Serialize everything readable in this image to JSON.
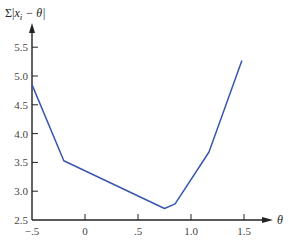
{
  "chart_data": {
    "type": "line",
    "title": "",
    "ylabel": "Σ|x_i − θ|",
    "xlabel": "θ",
    "xlim": [
      -0.5,
      1.7
    ],
    "ylim": [
      2.5,
      5.7
    ],
    "grid": false,
    "legend": null,
    "x_ticks": [
      {
        "value": -0.5,
        "label": "−.5"
      },
      {
        "value": 0,
        "label": "0"
      },
      {
        "value": 0.5,
        "label": ".5"
      },
      {
        "value": 1.0,
        "label": "1.0"
      },
      {
        "value": 1.5,
        "label": "1.5"
      }
    ],
    "y_ticks": [
      {
        "value": 2.5,
        "label": "2.5"
      },
      {
        "value": 3.0,
        "label": "3.0"
      },
      {
        "value": 3.5,
        "label": "3.5"
      },
      {
        "value": 4.0,
        "label": "4.0"
      },
      {
        "value": 4.5,
        "label": "4.5"
      },
      {
        "value": 5.0,
        "label": "5.0"
      },
      {
        "value": 5.5,
        "label": "5.5"
      }
    ],
    "series": [
      {
        "name": "Σ|x_i − θ|",
        "color": "#3a57b0",
        "x": [
          -0.5,
          -0.2,
          0.75,
          0.85,
          1.17,
          1.48
        ],
        "y": [
          4.85,
          3.53,
          2.7,
          2.78,
          3.68,
          5.27
        ]
      }
    ]
  },
  "labels": {
    "y_axis_title_sigma": "Σ|",
    "y_axis_title_x": "x",
    "y_axis_title_sub": "i",
    "y_axis_title_rest": " − θ|",
    "x_axis_title": "θ"
  }
}
